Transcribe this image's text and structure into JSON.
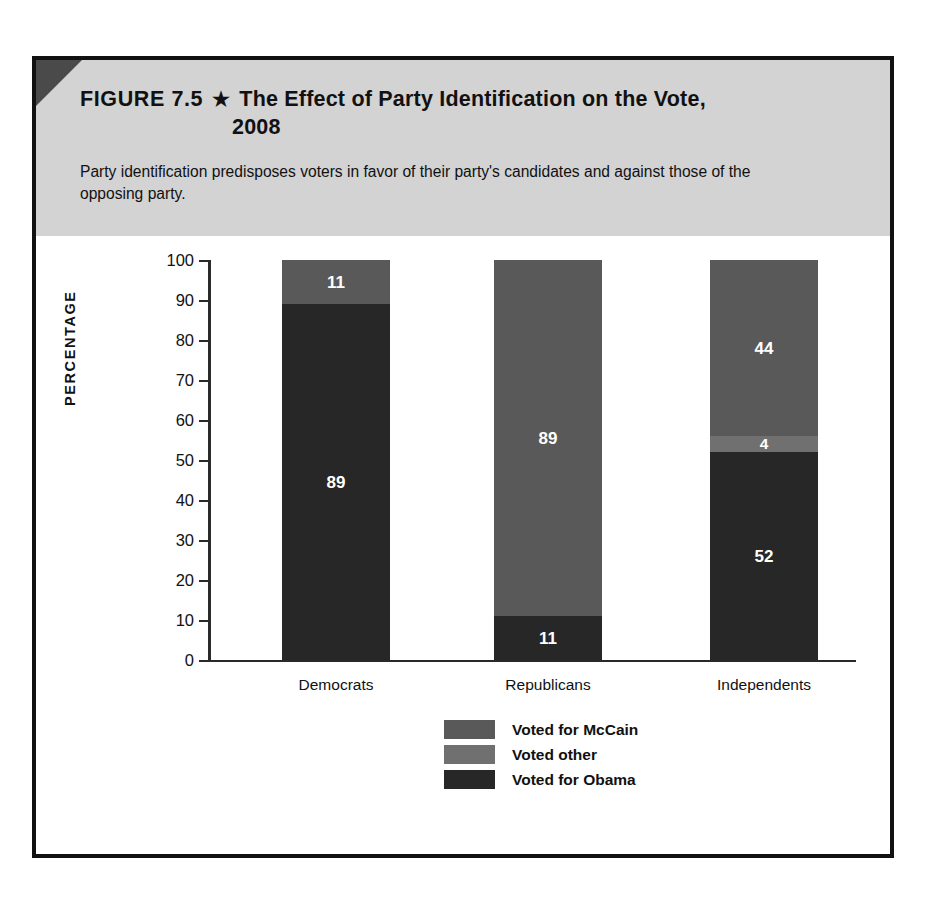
{
  "figure": {
    "label": "FIGURE 7.5",
    "star_icon": "★",
    "title_line1": "The Effect of Party Identification on the Vote,",
    "title_line2": "2008",
    "subtitle": "Party identification predisposes voters in favor of their party's candidates and against those of the opposing party."
  },
  "chart_data": {
    "type": "bar",
    "subtype": "stacked-vertical",
    "title": "The Effect of Party Identification on the Vote, 2008",
    "xlabel": "",
    "ylabel": "PERCENTAGE",
    "ylim": [
      0,
      100
    ],
    "yticks": [
      0,
      10,
      20,
      30,
      40,
      50,
      60,
      70,
      80,
      90,
      100
    ],
    "ytick_labels": [
      "0",
      "10",
      "20",
      "30",
      "40",
      "50",
      "60",
      "70",
      "80",
      "90",
      "100"
    ],
    "grid": false,
    "legend_position": "bottom-center",
    "categories": [
      "Democrats",
      "Republicans",
      "Independents"
    ],
    "series": [
      {
        "name": "Voted for McCain",
        "color": "#595959",
        "values": [
          11,
          89,
          44
        ]
      },
      {
        "name": "Voted other",
        "color": "#707070",
        "values": [
          0,
          0,
          4
        ]
      },
      {
        "name": "Voted for Obama",
        "color": "#272727",
        "values": [
          89,
          11,
          52
        ]
      }
    ],
    "stacks": [
      {
        "category": "Democrats",
        "total": 100,
        "segments": [
          {
            "series": "Voted for McCain",
            "value": 11,
            "label": "11"
          },
          {
            "series": "Voted for Obama",
            "value": 89,
            "label": "89"
          }
        ]
      },
      {
        "category": "Republicans",
        "total": 100,
        "segments": [
          {
            "series": "Voted for McCain",
            "value": 89,
            "label": "89"
          },
          {
            "series": "Voted for Obama",
            "value": 11,
            "label": "11"
          }
        ]
      },
      {
        "category": "Independents",
        "total": 100,
        "segments": [
          {
            "series": "Voted for McCain",
            "value": 44,
            "label": "44"
          },
          {
            "series": "Voted other",
            "value": 4,
            "label": "4"
          },
          {
            "series": "Voted for Obama",
            "value": 52,
            "label": "52"
          }
        ]
      }
    ]
  },
  "legend": {
    "items": [
      {
        "label": "Voted for McCain",
        "color": "#595959"
      },
      {
        "label": "Voted other",
        "color": "#707070"
      },
      {
        "label": "Voted for Obama",
        "color": "#272727"
      }
    ]
  },
  "axis": {
    "y_title": "PERCENTAGE",
    "ticks": [
      "100",
      "90",
      "80",
      "70",
      "60",
      "50",
      "40",
      "30",
      "20",
      "10",
      "0"
    ]
  },
  "colors": {
    "header_band": "#d3d3d3",
    "frame": "#111111",
    "corner_fold": "#4a4a4a",
    "mccain": "#595959",
    "other": "#707070",
    "obama": "#272727",
    "axis": "#2a2a2a"
  }
}
